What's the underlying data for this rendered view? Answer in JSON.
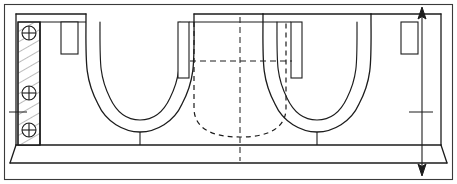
{
  "drawing": {
    "type": "engineering-cross-section",
    "title": "Double U-channel mould cross-section",
    "canvas": {
      "width": 457,
      "height": 184
    },
    "colors": {
      "background": "#ffffff",
      "line": "#1c1c1c",
      "hidden_line": "#1c1c1c",
      "hatch": "#555555",
      "frame": "#3a3a3a"
    },
    "line_weights": {
      "frame": 1.1,
      "outline": 1.3,
      "thin": 1.0,
      "hidden": 1.2,
      "hatch": 0.7,
      "centerline": 1.0
    },
    "frame": {
      "label": "drawing-border",
      "x": 4,
      "y": 4,
      "width": 449,
      "height": 176
    },
    "body": {
      "label": "section-outline",
      "top_y": 14,
      "base_top_y": 145,
      "base_bottom_y": 163,
      "left_x": 16,
      "right_x": 441
    },
    "hatched_block": {
      "label": "left-hatched-wall",
      "x": 18,
      "y": 22,
      "width": 22,
      "height": 123,
      "hatch_spacing": 9,
      "hatch_angle_deg": 60
    },
    "fasteners": [
      {
        "name": "fastener-top",
        "cx": 29,
        "cy": 33,
        "r": 7
      },
      {
        "name": "fastener-middle",
        "cx": 29,
        "cy": 93,
        "r": 7
      },
      {
        "name": "fastener-bottom",
        "cx": 29,
        "cy": 130,
        "r": 7
      }
    ],
    "center_tick": {
      "label": "left-centerline-tick",
      "x1": 8,
      "y1": 112,
      "x2": 26,
      "y2": 112
    },
    "slots": [
      {
        "name": "slot-left",
        "x": 61,
        "y": 22,
        "width": 17,
        "height": 32
      },
      {
        "name": "slot-right",
        "x": 401,
        "y": 22,
        "width": 17,
        "height": 32
      }
    ],
    "channels": [
      {
        "name": "channel-left",
        "outer": "M 44,22 L 44,145 L 44,145",
        "stem_x": 136,
        "stem_top_y": 128,
        "stem_bottom_y": 145
      },
      {
        "name": "channel-right",
        "stem_x": 345,
        "stem_top_y": 128,
        "stem_bottom_y": 145
      }
    ],
    "center_block": {
      "label": "center-raised-block",
      "x": 178,
      "y": 22,
      "width": 124,
      "height": 0,
      "left_strip_x": 178,
      "left_strip_w": 11,
      "right_strip_x": 291,
      "right_strip_w": 11,
      "strip_bottom_y": 78
    },
    "hidden_profile": {
      "label": "hidden-cavity-outline",
      "left_x": 194,
      "right_x": 286,
      "top_y": 22,
      "straight_bottom_y": 108,
      "bottom_y": 137,
      "corner_radius": 30
    },
    "centerlines": {
      "vertical": {
        "name": "vertical-centerline",
        "x": 240,
        "y1": 18,
        "y2": 160
      },
      "horizontal": {
        "name": "horizontal-centerline",
        "y": 61,
        "x1": 190,
        "x2": 292
      }
    },
    "dimension": {
      "name": "overall-height-dimension",
      "x": 422,
      "y_top": 10,
      "y_bottom": 172,
      "arrow_size": 7,
      "tick": {
        "x1": 408,
        "x2": 432,
        "y": 112
      },
      "value_label": ""
    }
  }
}
